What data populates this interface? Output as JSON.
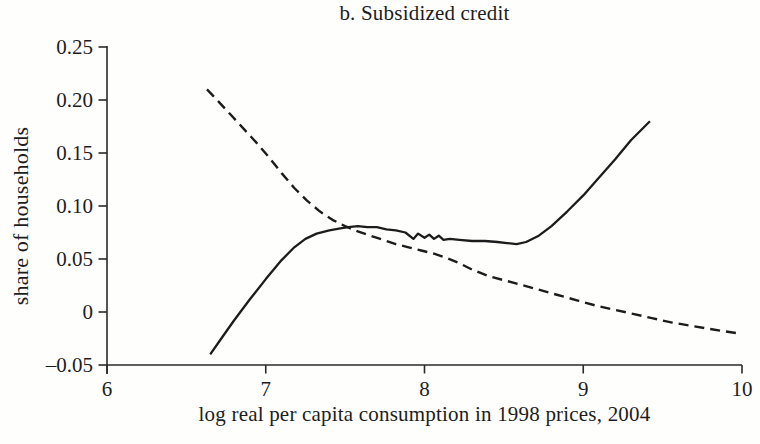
{
  "chart_data": {
    "type": "line",
    "title": "b. Subsidized credit",
    "xlabel": "log real per capita consumption in 1998 prices, 2004",
    "ylabel": "share of households",
    "xlim": [
      6,
      10
    ],
    "ylim": [
      -0.05,
      0.25
    ],
    "x_ticks": [
      6,
      7,
      8,
      9,
      10
    ],
    "x_tick_labels": [
      "6",
      "7",
      "8",
      "9",
      "10"
    ],
    "y_ticks": [
      -0.05,
      0,
      0.05,
      0.1,
      0.15,
      0.2,
      0.25
    ],
    "y_tick_labels": [
      "–0.05",
      "0",
      "0.05",
      "0.10",
      "0.15",
      "0.20",
      "0.25"
    ],
    "grid": false,
    "legend": "none",
    "axis_color": "#2a2a2a",
    "line_color": "#1c1c1c",
    "series": [
      {
        "name": "solid-line",
        "style": "solid",
        "points": [
          [
            6.65,
            -0.04
          ],
          [
            6.72,
            -0.025
          ],
          [
            6.8,
            -0.008
          ],
          [
            6.9,
            0.012
          ],
          [
            7.0,
            0.031
          ],
          [
            7.1,
            0.049
          ],
          [
            7.18,
            0.061
          ],
          [
            7.25,
            0.069
          ],
          [
            7.32,
            0.074
          ],
          [
            7.4,
            0.077
          ],
          [
            7.47,
            0.079
          ],
          [
            7.52,
            0.08
          ],
          [
            7.58,
            0.081
          ],
          [
            7.64,
            0.08
          ],
          [
            7.7,
            0.08
          ],
          [
            7.76,
            0.078
          ],
          [
            7.82,
            0.077
          ],
          [
            7.88,
            0.075
          ],
          [
            7.93,
            0.069
          ],
          [
            7.96,
            0.074
          ],
          [
            8.0,
            0.07
          ],
          [
            8.03,
            0.073
          ],
          [
            8.06,
            0.069
          ],
          [
            8.09,
            0.072
          ],
          [
            8.12,
            0.068
          ],
          [
            8.16,
            0.069
          ],
          [
            8.22,
            0.068
          ],
          [
            8.3,
            0.067
          ],
          [
            8.38,
            0.067
          ],
          [
            8.46,
            0.066
          ],
          [
            8.52,
            0.065
          ],
          [
            8.58,
            0.064
          ],
          [
            8.64,
            0.066
          ],
          [
            8.72,
            0.072
          ],
          [
            8.8,
            0.081
          ],
          [
            8.9,
            0.095
          ],
          [
            9.0,
            0.11
          ],
          [
            9.1,
            0.127
          ],
          [
            9.2,
            0.144
          ],
          [
            9.3,
            0.162
          ],
          [
            9.42,
            0.18
          ]
        ]
      },
      {
        "name": "dashed-line",
        "style": "dashed",
        "points": [
          [
            6.63,
            0.21
          ],
          [
            6.7,
            0.199
          ],
          [
            6.78,
            0.186
          ],
          [
            6.86,
            0.173
          ],
          [
            6.94,
            0.16
          ],
          [
            7.02,
            0.146
          ],
          [
            7.1,
            0.131
          ],
          [
            7.18,
            0.117
          ],
          [
            7.26,
            0.105
          ],
          [
            7.34,
            0.095
          ],
          [
            7.42,
            0.087
          ],
          [
            7.5,
            0.081
          ],
          [
            7.58,
            0.076
          ],
          [
            7.66,
            0.072
          ],
          [
            7.74,
            0.068
          ],
          [
            7.82,
            0.064
          ],
          [
            7.9,
            0.061
          ],
          [
            7.98,
            0.058
          ],
          [
            8.06,
            0.055
          ],
          [
            8.14,
            0.051
          ],
          [
            8.22,
            0.046
          ],
          [
            8.3,
            0.04
          ],
          [
            8.4,
            0.034
          ],
          [
            8.5,
            0.03
          ],
          [
            8.6,
            0.026
          ],
          [
            8.72,
            0.021
          ],
          [
            8.84,
            0.016
          ],
          [
            8.96,
            0.011
          ],
          [
            9.08,
            0.006
          ],
          [
            9.2,
            0.002
          ],
          [
            9.32,
            -0.002
          ],
          [
            9.44,
            -0.006
          ],
          [
            9.56,
            -0.01
          ],
          [
            9.68,
            -0.013
          ],
          [
            9.8,
            -0.016
          ],
          [
            9.88,
            -0.018
          ],
          [
            9.97,
            -0.02
          ]
        ]
      }
    ]
  }
}
